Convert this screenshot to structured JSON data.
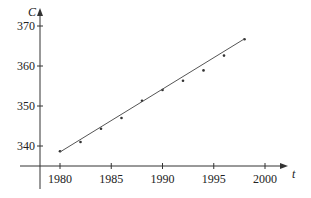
{
  "chart_data": {
    "type": "scatter",
    "title": "",
    "xlabel": "t",
    "ylabel": "C",
    "xlim": [
      1976,
      2003
    ],
    "ylim": [
      334,
      372
    ],
    "x_ticks": [
      1980,
      1985,
      1990,
      1995,
      2000
    ],
    "y_ticks": [
      340,
      350,
      360,
      370
    ],
    "grid": false,
    "legend": null,
    "series": [
      {
        "name": "data points",
        "type": "scatter",
        "x": [
          1980,
          1982,
          1984,
          1986,
          1988,
          1990,
          1992,
          1994,
          1996,
          1998
        ],
        "values": [
          338.7,
          341.0,
          344.3,
          347.0,
          351.3,
          354.0,
          356.3,
          358.9,
          362.6,
          366.7
        ]
      },
      {
        "name": "regression line",
        "type": "line",
        "x": [
          1980,
          1998
        ],
        "values": [
          338.5,
          366.8
        ]
      }
    ]
  },
  "layout": {
    "origin_px": [
      40,
      166
    ],
    "x_px_per_unit": 10.25,
    "y_px_per_unit": 4.0,
    "y_ref_value": 370,
    "y_ref_px": 26,
    "x_ref_value": 1980,
    "x_ref_px": 60
  },
  "colors": {
    "axis": "#333333",
    "line": "#555555",
    "point": "#333333",
    "text": "#222222"
  }
}
